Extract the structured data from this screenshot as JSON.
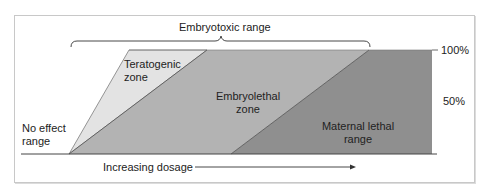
{
  "title": "Embryotoxic range",
  "zones": {
    "no_effect": "No effect\nrange",
    "teratogenic": "Teratogenic\nzone",
    "embryolethal": "Embryolethal\nzone",
    "maternal_lethal": "Maternal lethal\nrange"
  },
  "axis": {
    "y_ticks": [
      "100%",
      "50%"
    ],
    "x_label": "Increasing dosage"
  },
  "colors": {
    "teratogenic": "#e3e3e3",
    "embryolethal": "#b3b3b3",
    "maternal_lethal": "#8f8f8f",
    "line": "#333333"
  }
}
